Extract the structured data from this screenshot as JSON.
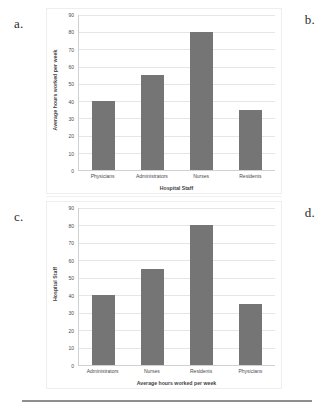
{
  "figure": {
    "panels": [
      {
        "letter": "a.",
        "corner_letter": "b.",
        "chart_index": 0
      },
      {
        "letter": "c.",
        "corner_letter": "d.",
        "chart_index": 1
      }
    ]
  },
  "chart_data": [
    {
      "type": "bar",
      "title": "",
      "categories": [
        "Physicians",
        "Administrators",
        "Nurses",
        "Residents"
      ],
      "values": [
        40,
        55,
        80,
        35
      ],
      "xlabel": "Hospital Staff",
      "ylabel": "Average hours worked per week",
      "ylim": [
        0,
        90
      ],
      "ytick_step": 10,
      "yticks": [
        90,
        80,
        70,
        60,
        50,
        40,
        30,
        20,
        10,
        0
      ],
      "grid": true,
      "legend": "none",
      "bar_color": "#757575",
      "gridline_color": "#e6e6e6",
      "axis_color": "#d0d0d0"
    },
    {
      "type": "bar",
      "title": "",
      "categories": [
        "Administrators",
        "Nurses",
        "Residents",
        "Physicians"
      ],
      "values": [
        40,
        55,
        80,
        35
      ],
      "xlabel": "Average hours worked per week",
      "ylabel": "Hospital Staff",
      "ylim": [
        0,
        90
      ],
      "ytick_step": 10,
      "yticks": [
        90,
        80,
        70,
        60,
        50,
        40,
        30,
        20,
        10,
        0
      ],
      "grid": true,
      "legend": "none",
      "bar_color": "#757575",
      "gridline_color": "#e6e6e6",
      "axis_color": "#d0d0d0"
    }
  ]
}
